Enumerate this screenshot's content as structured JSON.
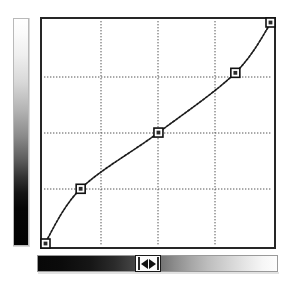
{
  "panel": {
    "name": "curves-adjustment-panel",
    "background": "#ffffff"
  },
  "output_ramp": {
    "label": "Output tone ramp",
    "orientation": "vertical",
    "top_color": "#ffffff",
    "bottom_color": "#000000"
  },
  "input_ramp": {
    "label": "Input tone ramp",
    "orientation": "horizontal",
    "left_color": "#000000",
    "right_color": "#ffffff"
  },
  "gamma_slider": {
    "name": "gamma-slider-handle",
    "left_arrow": "◀",
    "right_arrow": "▶",
    "position_percent": 46
  },
  "grid": {
    "columns": 4,
    "rows": 4,
    "gridline_color": "#555555",
    "border_color": "#262626",
    "gridline_style": "dotted"
  },
  "chart_data": {
    "type": "line",
    "title": "",
    "xlabel": "Input",
    "ylabel": "Output",
    "xlim": [
      0,
      255
    ],
    "ylim": [
      0,
      255
    ],
    "grid": true,
    "legend": "none",
    "curve_style": "dotted",
    "curve_color": "#1a1a1a",
    "xticks": [
      0,
      64,
      128,
      192,
      255
    ],
    "yticks": [
      0,
      64,
      128,
      192,
      255
    ],
    "series": [
      {
        "name": "Tone curve",
        "control_points": [
          {
            "input": 0,
            "output": 0
          },
          {
            "input": 41,
            "output": 64
          },
          {
            "input": 128,
            "output": 128
          },
          {
            "input": 214,
            "output": 196
          },
          {
            "input": 255,
            "output": 255
          }
        ],
        "x": [
          0,
          41,
          128,
          214,
          255
        ],
        "y": [
          0,
          64,
          128,
          196,
          255
        ]
      }
    ],
    "control_point_marker": "square",
    "control_point_count": 5
  }
}
